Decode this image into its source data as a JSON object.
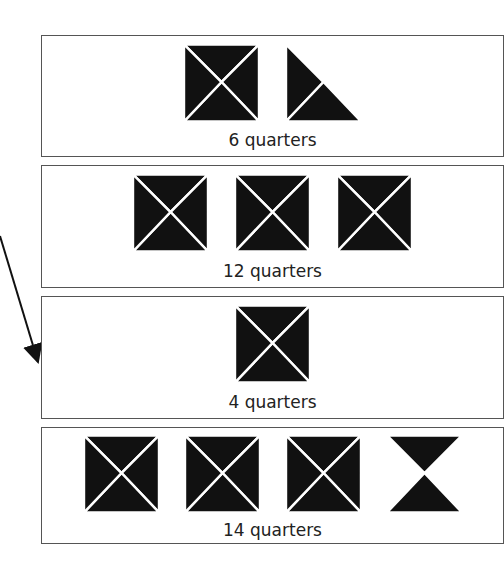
{
  "cards": [
    {
      "label": "6 quarters",
      "shapes": [
        "full-square",
        "half-square"
      ]
    },
    {
      "label": "12 quarters",
      "shapes": [
        "full-square",
        "full-square",
        "full-square"
      ]
    },
    {
      "label": "4 quarters",
      "shapes": [
        "full-square"
      ]
    },
    {
      "label": "14 quarters",
      "shapes": [
        "full-square",
        "full-square",
        "full-square",
        "half-square-hourglass"
      ]
    }
  ],
  "arrow": {
    "icon": "arrow-icon",
    "points_to": "4 quarters"
  },
  "colors": {
    "fill": "#111111",
    "border": "#555555",
    "background": "#ffffff"
  }
}
